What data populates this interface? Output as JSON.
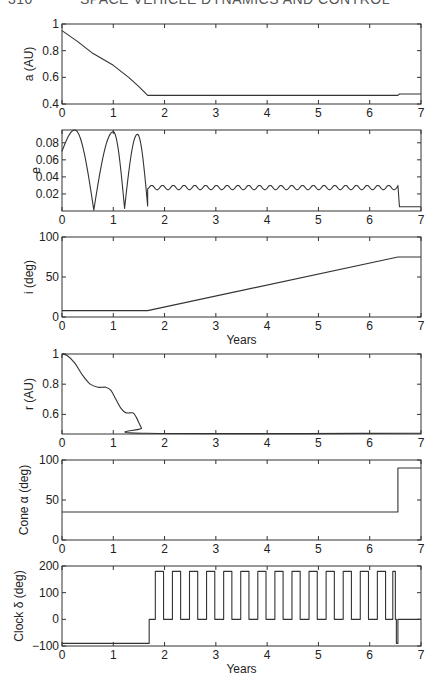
{
  "header": {
    "page_number": "310",
    "running_title": "SPACE VEHICLE DYNAMICS AND CONTROL"
  },
  "chart_data": [
    {
      "type": "line",
      "id": "a",
      "ylabel": "a (AU)",
      "xlabel": "",
      "xlim": [
        0,
        7
      ],
      "ylim": [
        0.4,
        1
      ],
      "xticks": [
        0,
        1,
        2,
        3,
        4,
        5,
        6,
        7
      ],
      "yticks": [
        0.4,
        0.6,
        0.8,
        1
      ],
      "ytick_labels": [
        "0.4",
        "0.6",
        "0.8",
        "1"
      ],
      "grid": false,
      "x": [
        0,
        0.3,
        0.6,
        1.0,
        1.3,
        1.5,
        1.67,
        6.55,
        6.58,
        7.0
      ],
      "y": [
        0.95,
        0.87,
        0.78,
        0.69,
        0.6,
        0.53,
        0.465,
        0.465,
        0.475,
        0.475
      ]
    },
    {
      "type": "line",
      "id": "e",
      "ylabel": "e",
      "xlabel": "",
      "xlim": [
        0,
        7
      ],
      "ylim": [
        0,
        0.095
      ],
      "xticks": [
        0,
        1,
        2,
        3,
        4,
        5,
        6,
        7
      ],
      "yticks": [
        0.02,
        0.04,
        0.06,
        0.08
      ],
      "ytick_labels": [
        "0.02",
        "0.04",
        "0.06",
        "0.08"
      ],
      "grid": false,
      "segments": [
        {
          "description": "arches",
          "x": [
            0,
            0.25,
            0.62,
            1.0,
            1.22,
            1.47,
            1.67
          ],
          "y": [
            0.07,
            0.095,
            0.001,
            0.093,
            0.003,
            0.09,
            0.006
          ]
        },
        {
          "description": "ripple",
          "x_start": 1.67,
          "x_end": 6.55,
          "min": 0.025,
          "max": 0.03,
          "period": 0.21
        },
        {
          "description": "final",
          "x": [
            6.55,
            6.58,
            7.0
          ],
          "y": [
            0.03,
            0.005,
            0.005
          ]
        }
      ]
    },
    {
      "type": "line",
      "id": "i",
      "ylabel": "i (deg)",
      "xlabel": "Years",
      "xlim": [
        0,
        7
      ],
      "ylim": [
        0,
        100
      ],
      "xticks": [
        0,
        1,
        2,
        3,
        4,
        5,
        6,
        7
      ],
      "yticks": [
        0,
        50,
        100
      ],
      "ytick_labels": [
        "0",
        "50",
        "100"
      ],
      "grid": false,
      "x": [
        0,
        1.67,
        6.55,
        7.0
      ],
      "y": [
        8,
        8,
        75,
        75
      ]
    },
    {
      "type": "line",
      "id": "r",
      "ylabel": "r (AU)",
      "xlabel": "",
      "xlim": [
        0,
        7
      ],
      "ylim": [
        0.47,
        1
      ],
      "xticks": [
        0,
        1,
        2,
        3,
        4,
        5,
        6,
        7
      ],
      "yticks": [
        0.6,
        0.8,
        1
      ],
      "ytick_labels": [
        "0.6",
        "0.8",
        "1"
      ],
      "grid": false,
      "x": [
        0,
        0.1,
        0.25,
        0.4,
        0.55,
        0.7,
        0.85,
        0.95,
        1.05,
        1.15,
        1.25,
        1.38,
        1.45,
        1.55,
        1.65,
        7.0
      ],
      "y": [
        1.0,
        0.99,
        0.94,
        0.86,
        0.8,
        0.78,
        0.78,
        0.76,
        0.7,
        0.64,
        0.61,
        0.61,
        0.58,
        0.51,
        0.475,
        0.475
      ]
    },
    {
      "type": "line",
      "id": "cone",
      "ylabel": "Cone α (deg)",
      "xlabel": "",
      "xlim": [
        0,
        7
      ],
      "ylim": [
        0,
        100
      ],
      "xticks": [
        0,
        1,
        2,
        3,
        4,
        5,
        6,
        7
      ],
      "yticks": [
        0,
        50,
        100
      ],
      "ytick_labels": [
        "0",
        "50",
        "100"
      ],
      "grid": false,
      "x": [
        0,
        6.55,
        6.55,
        7.0
      ],
      "y": [
        35,
        35,
        90,
        90
      ]
    },
    {
      "type": "line",
      "id": "clock",
      "ylabel": "Clock δ (deg)",
      "xlabel": "Years",
      "xlim": [
        0,
        7
      ],
      "ylim": [
        -100,
        200
      ],
      "xticks": [
        0,
        1,
        2,
        3,
        4,
        5,
        6,
        7
      ],
      "yticks": [
        -100,
        0,
        100,
        200
      ],
      "ytick_labels": [
        "−100",
        "0",
        "100",
        "200"
      ],
      "grid": false,
      "segments": [
        {
          "description": "initial",
          "x": [
            0,
            1.7
          ],
          "y": [
            -90,
            -90
          ]
        },
        {
          "description": "step",
          "x": [
            1.7,
            1.82
          ],
          "y": [
            0,
            0
          ]
        },
        {
          "description": "square-wave",
          "x_start": 1.82,
          "period": 0.333,
          "high_width": 0.16,
          "high": 180,
          "low": 0,
          "pulses": 14
        },
        {
          "description": "last-pulse",
          "x": [
            6.45,
            6.5
          ],
          "y": [
            180,
            180
          ]
        },
        {
          "description": "dip",
          "x": [
            6.52,
            6.55
          ],
          "y": [
            -90,
            -90
          ]
        },
        {
          "description": "final",
          "x": [
            6.55,
            7.0
          ],
          "y": [
            0,
            0
          ]
        }
      ]
    }
  ]
}
